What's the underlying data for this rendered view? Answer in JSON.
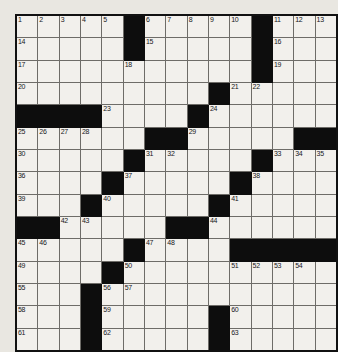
{
  "puzzle": {
    "kind": "crossword-grid",
    "rows": 15,
    "columns": 15,
    "colors": {
      "page_background": "#e9e7e1",
      "cell_fill": "#f2f0ec",
      "block_fill": "#0d0d0d",
      "grid_line": "#6e6c68",
      "outer_border": "#111111",
      "number_text": "#17171a"
    },
    "highest_clue_number": 63,
    "block_count": 55,
    "grid": [
      [
        "1",
        "2",
        "3",
        "4",
        "5",
        "#",
        "6",
        "7",
        "8",
        "9",
        "10",
        "#",
        "11",
        "12",
        "13"
      ],
      [
        "14",
        "",
        "",
        "",
        "",
        "#",
        "15",
        "",
        "",
        "",
        "",
        "#",
        "16",
        "",
        ""
      ],
      [
        "17",
        "",
        "",
        "",
        "",
        "18",
        "",
        "",
        "",
        "",
        "",
        "#",
        "19",
        "",
        ""
      ],
      [
        "20",
        "",
        "",
        "",
        "",
        "",
        "",
        "",
        "",
        "#",
        "21",
        "22",
        "",
        "",
        ""
      ],
      [
        "#",
        "#",
        "#",
        "#",
        "23",
        "",
        "",
        "",
        "#",
        "24",
        "",
        "",
        "",
        "",
        ""
      ],
      [
        "25",
        "26",
        "27",
        "28",
        "",
        "",
        "#",
        "#",
        "29",
        "",
        "",
        "",
        "",
        "#",
        "#"
      ],
      [
        "30",
        "",
        "",
        "",
        "",
        "#",
        "31",
        "32",
        "",
        "",
        "",
        "#",
        "33",
        "34",
        "35"
      ],
      [
        "36",
        "",
        "",
        "",
        "#",
        "37",
        "",
        "",
        "",
        "",
        "#",
        "38",
        "",
        "",
        ""
      ],
      [
        "39",
        "",
        "",
        "#",
        "40",
        "",
        "",
        "",
        "",
        "#",
        "41",
        "",
        "",
        "",
        ""
      ],
      [
        "#",
        "#",
        "42",
        "43",
        "",
        "",
        "",
        "#",
        "#",
        "44",
        "",
        "",
        "",
        "",
        ""
      ],
      [
        "45",
        "46",
        "",
        "",
        "",
        "#",
        "47",
        "48",
        "",
        "",
        "#",
        "#",
        "#",
        "#",
        "#"
      ],
      [
        "49",
        "",
        "",
        "",
        "#",
        "50",
        "",
        "",
        "",
        "",
        "51",
        "52",
        "53",
        "54",
        ""
      ],
      [
        "55",
        "",
        "",
        "#",
        "56",
        "57",
        "",
        "",
        "",
        "",
        "",
        "",
        "",
        "",
        ""
      ],
      [
        "58",
        "",
        "",
        "#",
        "59",
        "",
        "",
        "",
        "",
        "#",
        "60",
        "",
        "",
        "",
        ""
      ],
      [
        "61",
        "",
        "",
        "#",
        "62",
        "",
        "",
        "",
        "",
        "#",
        "63",
        "",
        "",
        "",
        ""
      ]
    ]
  }
}
